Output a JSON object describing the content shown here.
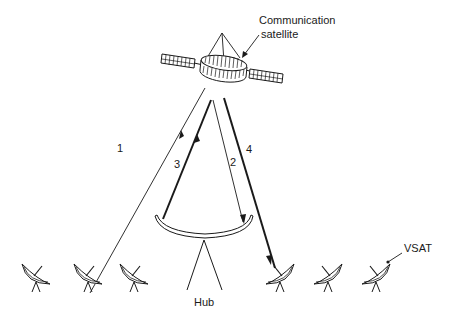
{
  "diagram": {
    "type": "VSAT star network via communication satellite",
    "labels": {
      "satellite_line1": "Communication",
      "satellite_line2": "satellite",
      "hub": "Hub",
      "vsat": "VSAT"
    },
    "links": [
      {
        "id": "1",
        "label": "1",
        "from": "VSAT",
        "to": "Communication satellite",
        "weight": "thin"
      },
      {
        "id": "2",
        "label": "2",
        "from": "Communication satellite",
        "to": "Hub",
        "weight": "thin"
      },
      {
        "id": "3",
        "label": "3",
        "from": "Hub",
        "to": "Communication satellite",
        "weight": "thick"
      },
      {
        "id": "4",
        "label": "4",
        "from": "Communication satellite",
        "to": "VSAT",
        "weight": "thick"
      }
    ],
    "vsat_count": 6,
    "colors": {
      "stroke": "#1a1a1a",
      "background": "#ffffff"
    }
  }
}
